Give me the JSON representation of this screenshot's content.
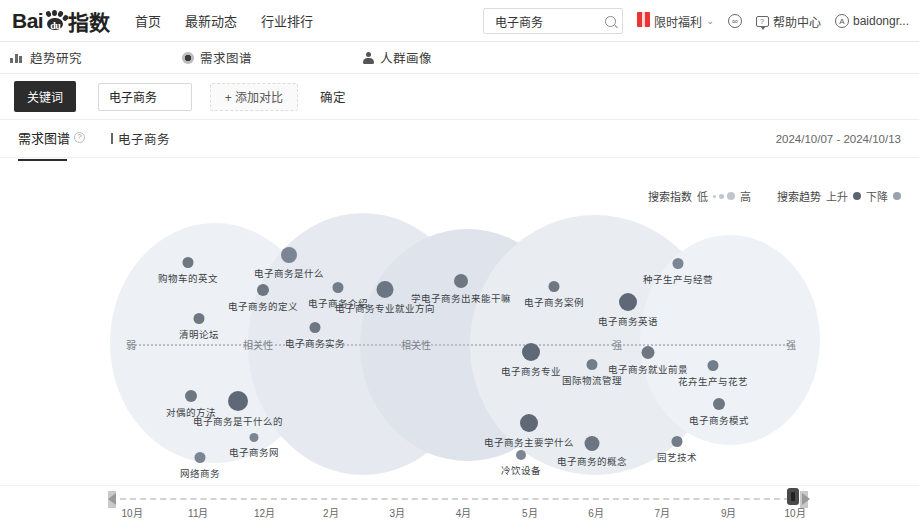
{
  "header": {
    "logo_text_left": "Bai",
    "logo_text_right": "指数",
    "logo_du": "du",
    "nav": [
      {
        "label": "首页"
      },
      {
        "label": "最新动态"
      },
      {
        "label": "行业排行"
      }
    ],
    "search": {
      "value": "电子商务",
      "placeholder": "请输入关键词"
    },
    "right_items": [
      {
        "label": "限时福利",
        "icon": "gift-icon",
        "caret": "⌄"
      },
      {
        "label": "",
        "icon": "link-icon"
      },
      {
        "label": "帮助中心",
        "icon": "help-chat-icon"
      },
      {
        "label": "baidongr...",
        "icon": "avatar-icon"
      }
    ]
  },
  "subnav": {
    "items": [
      {
        "label": "趋势研究",
        "icon": "trend-chart-icon"
      },
      {
        "label": "需求图谱",
        "icon": "demand-graph-icon"
      },
      {
        "label": "人群画像",
        "icon": "crowd-person-icon"
      }
    ]
  },
  "keyword_bar": {
    "tag_label": "关键词",
    "keyword_value": "电子商务",
    "keyword_placeholder": "请输入关键词",
    "add_compare_label": "+ 添加对比",
    "confirm_label": "确定"
  },
  "panel": {
    "tab_label": "需求图谱",
    "help_mark": "?",
    "current_keyword": "电子商务",
    "date_range": "2024/10/07 - 2024/10/13"
  },
  "legend": {
    "index_title": "搜索指数",
    "index_low": "低",
    "index_high": "高",
    "trend_title": "搜索趋势",
    "trend_up": "上升",
    "trend_down": "下降",
    "color_up": "#5b6470",
    "color_down": "#9aa3ad"
  },
  "axis": {
    "left_label": "弱",
    "mid_label": "相关性",
    "mid_label2": "相关性",
    "mid_label3": "强",
    "right_label": "强"
  },
  "chart_data": {
    "type": "scatter",
    "xlabel": "相关性（弱 → 强）",
    "ylabel": "",
    "grid": false,
    "legend_position": "top-right",
    "nodes": [
      {
        "label": "购物车的英文",
        "x": 188,
        "y": 262,
        "r": 5.5,
        "color": "#6e7782"
      },
      {
        "label": "电子商务是什么",
        "x": 289,
        "y": 255,
        "r": 8.0,
        "color": "#7b8593"
      },
      {
        "label": "电子商务的定义",
        "x": 263,
        "y": 290,
        "r": 6.0,
        "color": "#6e7782"
      },
      {
        "label": "电子商务介绍",
        "x": 338,
        "y": 287,
        "r": 5.5,
        "color": "#737d89"
      },
      {
        "label": "电子商务专业就业方向",
        "x": 385,
        "y": 289,
        "r": 8.5,
        "color": "#6c7682"
      },
      {
        "label": "学电子商务出来能干嘛",
        "x": 461,
        "y": 281,
        "r": 7.0,
        "color": "#6e7782"
      },
      {
        "label": "电子商务案例",
        "x": 554,
        "y": 286,
        "r": 5.5,
        "color": "#6e7782"
      },
      {
        "label": "种子生产与经营",
        "x": 678,
        "y": 263,
        "r": 5.5,
        "color": "#7b8593"
      },
      {
        "label": "电子商务英语",
        "x": 628,
        "y": 302,
        "r": 9.0,
        "color": "#5f6876"
      },
      {
        "label": "清明论坛",
        "x": 199,
        "y": 318,
        "r": 5.5,
        "color": "#6e7782"
      },
      {
        "label": "电子商务实务",
        "x": 315,
        "y": 327,
        "r": 5.5,
        "color": "#6e7782"
      },
      {
        "label": "电子商务专业",
        "x": 531,
        "y": 352,
        "r": 9.0,
        "color": "#5f6876"
      },
      {
        "label": "国际物流管理",
        "x": 592,
        "y": 364,
        "r": 5.5,
        "color": "#737d89"
      },
      {
        "label": "电子商务就业前景",
        "x": 648,
        "y": 352,
        "r": 6.5,
        "color": "#6e7782"
      },
      {
        "label": "花卉生产与花艺",
        "x": 713,
        "y": 365,
        "r": 5.5,
        "color": "#737d89"
      },
      {
        "label": "对偶的方法",
        "x": 191,
        "y": 396,
        "r": 6.0,
        "color": "#6e7782"
      },
      {
        "label": "电子商务是干什么的",
        "x": 238,
        "y": 401,
        "r": 10.0,
        "color": "#5f6876"
      },
      {
        "label": "电子商务网",
        "x": 254,
        "y": 437,
        "r": 4.5,
        "color": "#7b8593"
      },
      {
        "label": "电子商务主要学什么",
        "x": 529,
        "y": 423,
        "r": 9.0,
        "color": "#5f6876"
      },
      {
        "label": "电子商务模式",
        "x": 719,
        "y": 404,
        "r": 6.0,
        "color": "#6e7782"
      },
      {
        "label": "电子商务的概念",
        "x": 592,
        "y": 443,
        "r": 7.5,
        "color": "#6b7481"
      },
      {
        "label": "园艺技术",
        "x": 677,
        "y": 441,
        "r": 5.5,
        "color": "#737d89"
      },
      {
        "label": "冷饮设备",
        "x": 521,
        "y": 455,
        "r": 5.0,
        "color": "#7b8593"
      },
      {
        "label": "网络商务",
        "x": 200,
        "y": 457,
        "r": 5.5,
        "color": "#7b8593"
      }
    ]
  },
  "timeline": {
    "ticks": [
      "10月",
      "11月",
      "12月",
      "2月",
      "3月",
      "4月",
      "5月",
      "6月",
      "7月",
      "9月",
      "10月"
    ],
    "handle_position_label": "10月",
    "prev_label": "上一页",
    "next_label": "下一页"
  }
}
